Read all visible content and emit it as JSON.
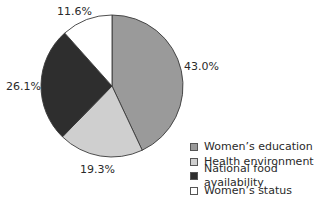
{
  "chart_data": {
    "type": "pie",
    "title": "",
    "categories": [
      "Women's education",
      "Health environment",
      "National food availability",
      "Women's status"
    ],
    "values": [
      43.0,
      19.3,
      26.1,
      11.6
    ],
    "unit": "%",
    "labels": [
      "43.0%",
      "19.3%",
      "26.1%",
      "11.6%"
    ],
    "colors": [
      "#9a9a9a",
      "#cfcfcf",
      "#2e2e2e",
      "#ffffff"
    ],
    "start_angle": "12 o'clock, clockwise",
    "legend_position": "bottom-right"
  },
  "legend": {
    "items": [
      {
        "label": "Women’s education",
        "color": "#9a9a9a"
      },
      {
        "label": "Health environment",
        "color": "#cfcfcf"
      },
      {
        "label": "National food availability",
        "color": "#2e2e2e"
      },
      {
        "label": "Women’s status",
        "color": "#ffffff"
      }
    ]
  },
  "slice_labels": {
    "womens_education": "43.0%",
    "health_environment": "19.3%",
    "national_food": "26.1%",
    "womens_status": "11.6%"
  }
}
